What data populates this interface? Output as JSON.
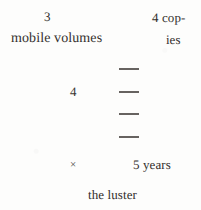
{
  "page": {
    "background_color": "#fdfdfc",
    "ink_color": "#332f2c",
    "width": 201,
    "height": 210
  },
  "lines": {
    "numeral_3": "3",
    "mobile_volumes": "mobile volumes",
    "copies_first": "4 cop-",
    "copies_second": "ies",
    "numeral_4": "4",
    "times_sign": "×",
    "five_years": "5 years",
    "the_luster": "the luster"
  },
  "dash_stack": {
    "count": 4,
    "rule_color": "#45413d",
    "items": [
      "—",
      "—",
      "—",
      "—"
    ]
  }
}
